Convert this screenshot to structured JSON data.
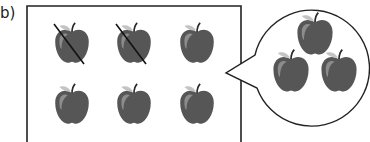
{
  "label": "b)",
  "colors": {
    "apple": "#5a5a5a",
    "apple_dark": "#454545",
    "highlight": "#8a8a8a",
    "leaf": "#bdbdbd",
    "stroke": "#222222"
  },
  "box": {
    "rows": 2,
    "cols": 3,
    "apples": [
      {
        "crossed": true
      },
      {
        "crossed": true
      },
      {
        "crossed": false
      },
      {
        "crossed": false
      },
      {
        "crossed": false
      },
      {
        "crossed": false
      }
    ]
  },
  "callout": {
    "apple_count": 3
  }
}
